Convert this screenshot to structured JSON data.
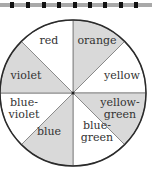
{
  "diagram": {
    "title": "",
    "type": "color-wheel",
    "center": [
      73,
      93
    ],
    "radius": 73,
    "fill_shaded": "#d9d9d9",
    "fill_plain": "#ffffff",
    "stroke": "#2a2a2a",
    "sectors": [
      {
        "name": "orange",
        "lines": [
          "orange"
        ],
        "shaded": true
      },
      {
        "name": "yellow",
        "lines": [
          "yellow"
        ],
        "shaded": false
      },
      {
        "name": "yellow-green",
        "lines": [
          "yellow-",
          "green"
        ],
        "shaded": true
      },
      {
        "name": "blue-green",
        "lines": [
          "blue-",
          "green"
        ],
        "shaded": false
      },
      {
        "name": "blue",
        "lines": [
          "blue"
        ],
        "shaded": true
      },
      {
        "name": "blue-violet",
        "lines": [
          "blue-",
          "violet"
        ],
        "shaded": false
      },
      {
        "name": "violet",
        "lines": [
          "violet"
        ],
        "shaded": true
      },
      {
        "name": "red",
        "lines": [
          "red"
        ],
        "shaded": false
      }
    ]
  },
  "topbar": {
    "marks_x": [
      12,
      28,
      44,
      59,
      75,
      90,
      105,
      121,
      136
    ]
  }
}
